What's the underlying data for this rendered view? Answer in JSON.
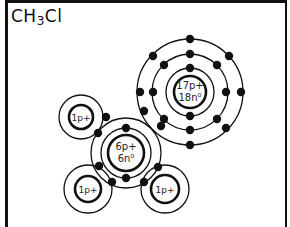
{
  "title": {
    "formula_main": "CH",
    "subscript": "3",
    "formula_tail": "Cl"
  },
  "atoms": {
    "chlorine": {
      "protons": "17p+",
      "neutrons": "18n⁰",
      "center": [
        190,
        92
      ],
      "rings": [
        24,
        37,
        52
      ]
    },
    "carbon": {
      "protons": "6p+",
      "neutrons": "6n⁰",
      "center": [
        126,
        153
      ],
      "rings": [
        25,
        35
      ]
    },
    "hydrogen_top_left": {
      "protons": "1p+",
      "center": [
        81,
        117
      ]
    },
    "hydrogen_bottom_left": {
      "protons": "1p+",
      "center": [
        88,
        189
      ]
    },
    "hydrogen_bottom_right": {
      "protons": "1p+",
      "center": [
        165,
        189
      ]
    }
  },
  "colors": {
    "ink": "#111111",
    "background": "#ffffff"
  }
}
